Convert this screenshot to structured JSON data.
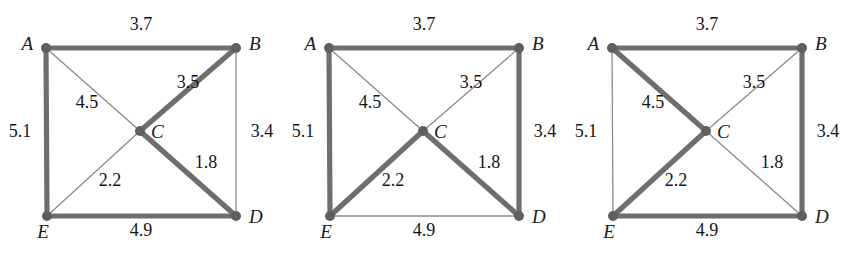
{
  "figure": {
    "background_color": "#ffffff",
    "bold_edge_color": "#6e6e6e",
    "thin_edge_color": "#8a8a8a",
    "vertex_color": "#5f5f5f",
    "text_color": "#141414"
  },
  "vertex_labels": {
    "A": "A",
    "B": "B",
    "C": "C",
    "D": "D",
    "E": "E"
  },
  "edge_weights": {
    "AB": "3.7",
    "AE": "5.1",
    "AC": "4.5",
    "BC": "3.5",
    "BD": "3.4",
    "CD": "1.8",
    "CE": "2.2",
    "ED": "4.9"
  },
  "graphs": [
    {
      "id": "graph-1",
      "index": 1,
      "edges": [
        {
          "id": "AB",
          "from": "A",
          "to": "B",
          "weight": "3.7",
          "style": "bold"
        },
        {
          "id": "AE",
          "from": "A",
          "to": "E",
          "weight": "5.1",
          "style": "bold"
        },
        {
          "id": "AC",
          "from": "A",
          "to": "C",
          "weight": "4.5",
          "style": "thin"
        },
        {
          "id": "BC",
          "from": "B",
          "to": "C",
          "weight": "3.5",
          "style": "bold"
        },
        {
          "id": "BD",
          "from": "B",
          "to": "D",
          "weight": "3.4",
          "style": "thin"
        },
        {
          "id": "CD",
          "from": "C",
          "to": "D",
          "weight": "1.8",
          "style": "bold"
        },
        {
          "id": "CE",
          "from": "C",
          "to": "E",
          "weight": "2.2",
          "style": "thin"
        },
        {
          "id": "ED",
          "from": "E",
          "to": "D",
          "weight": "4.9",
          "style": "bold"
        }
      ]
    },
    {
      "id": "graph-2",
      "index": 2,
      "edges": [
        {
          "id": "AB",
          "from": "A",
          "to": "B",
          "weight": "3.7",
          "style": "bold"
        },
        {
          "id": "AE",
          "from": "A",
          "to": "E",
          "weight": "5.1",
          "style": "bold"
        },
        {
          "id": "AC",
          "from": "A",
          "to": "C",
          "weight": "4.5",
          "style": "thin"
        },
        {
          "id": "BC",
          "from": "B",
          "to": "C",
          "weight": "3.5",
          "style": "thin"
        },
        {
          "id": "BD",
          "from": "B",
          "to": "D",
          "weight": "3.4",
          "style": "bold"
        },
        {
          "id": "CD",
          "from": "C",
          "to": "D",
          "weight": "1.8",
          "style": "bold"
        },
        {
          "id": "CE",
          "from": "C",
          "to": "E",
          "weight": "2.2",
          "style": "bold"
        },
        {
          "id": "ED",
          "from": "E",
          "to": "D",
          "weight": "4.9",
          "style": "thin"
        }
      ]
    },
    {
      "id": "graph-3",
      "index": 3,
      "edges": [
        {
          "id": "AB",
          "from": "A",
          "to": "B",
          "weight": "3.7",
          "style": "bold"
        },
        {
          "id": "AE",
          "from": "A",
          "to": "E",
          "weight": "5.1",
          "style": "thin"
        },
        {
          "id": "AC",
          "from": "A",
          "to": "C",
          "weight": "4.5",
          "style": "bold"
        },
        {
          "id": "BC",
          "from": "B",
          "to": "C",
          "weight": "3.5",
          "style": "thin"
        },
        {
          "id": "BD",
          "from": "B",
          "to": "D",
          "weight": "3.4",
          "style": "bold"
        },
        {
          "id": "CD",
          "from": "C",
          "to": "D",
          "weight": "1.8",
          "style": "thin"
        },
        {
          "id": "CE",
          "from": "C",
          "to": "E",
          "weight": "2.2",
          "style": "bold"
        },
        {
          "id": "ED",
          "from": "E",
          "to": "D",
          "weight": "4.9",
          "style": "bold"
        }
      ]
    }
  ],
  "geometry": {
    "panel_width": 283,
    "panel_height": 263,
    "panel_offsets": [
      0,
      283,
      566
    ],
    "vertices": {
      "A": {
        "x": 46,
        "y": 48
      },
      "B": {
        "x": 236,
        "y": 48
      },
      "C": {
        "x": 140,
        "y": 131
      },
      "D": {
        "x": 236,
        "y": 216
      },
      "E": {
        "x": 47,
        "y": 216
      }
    },
    "vertex_dot_radius": 5,
    "vertex_label_offsets": {
      "A": {
        "dx": -13,
        "dy": 2,
        "anchor": "end"
      },
      "B": {
        "dx": 13,
        "dy": 2,
        "anchor": "start"
      },
      "C": {
        "dx": 11,
        "dy": 7,
        "anchor": "start"
      },
      "D": {
        "dx": 13,
        "dy": 7,
        "anchor": "start"
      },
      "E": {
        "dx": -4,
        "dy": 22,
        "anchor": "middle"
      }
    },
    "weight_label_positions": {
      "AB": {
        "x": 141,
        "y": 30,
        "anchor": "middle"
      },
      "AE": {
        "x": 20,
        "y": 137,
        "anchor": "middle"
      },
      "AC": {
        "x": 87,
        "y": 108,
        "anchor": "middle"
      },
      "BC": {
        "x": 188,
        "y": 88,
        "anchor": "middle"
      },
      "BD": {
        "x": 262,
        "y": 137,
        "anchor": "middle"
      },
      "CD": {
        "x": 206,
        "y": 168,
        "anchor": "middle"
      },
      "CE": {
        "x": 110,
        "y": 186,
        "anchor": "middle"
      },
      "ED": {
        "x": 141,
        "y": 236,
        "anchor": "middle"
      }
    }
  }
}
